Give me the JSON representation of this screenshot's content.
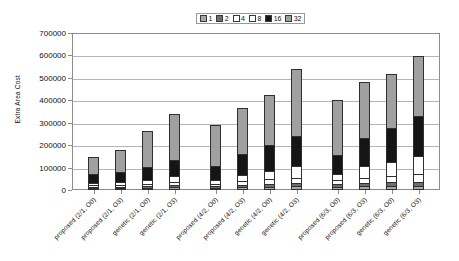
{
  "chart_data": {
    "type": "bar",
    "subtype": "stacked",
    "title": "",
    "xlabel": "",
    "ylabel": "Extra Area Cost",
    "ylim": [
      0,
      700000
    ],
    "ytick_step": 100000,
    "yticks": [
      "0",
      "100000",
      "200000",
      "300000",
      "400000",
      "500000",
      "600000",
      "700000"
    ],
    "grid": true,
    "legend_position": "top-center",
    "legend_title": "",
    "categories": [
      "proposed (2/1, O0)",
      "proposed (2/1, O3)",
      "genetic (2/1, O0)",
      "genetic (2/1, O3)",
      "proposed (4/2, O0)",
      "proposed (4/2, O3)",
      "genetic (4/2, O0)",
      "genetic (4/2, O3)",
      "proposed (6/3, O0)",
      "proposed (6/3, O3)",
      "genetic (6/3, O0)",
      "genetic (6/3, O3)"
    ],
    "series": [
      {
        "name": "1",
        "color": "#a8a8a8",
        "values": [
          8000,
          8000,
          10000,
          12000,
          10000,
          12000,
          14000,
          16000,
          14000,
          16000,
          18000,
          20000
        ]
      },
      {
        "name": "2",
        "color": "#6e6e6e",
        "values": [
          10000,
          10000,
          12000,
          14000,
          12000,
          14000,
          16000,
          18000,
          16000,
          18000,
          20000,
          22000
        ]
      },
      {
        "name": "4",
        "color": "#ffffff",
        "values": [
          14000,
          14000,
          16000,
          20000,
          16000,
          22000,
          26000,
          30000,
          22000,
          30000,
          34000,
          40000
        ]
      },
      {
        "name": "8",
        "color": "#ffffff",
        "values": [
          14000,
          16000,
          20000,
          28000,
          22000,
          34000,
          44000,
          56000,
          32000,
          56000,
          68000,
          82000
        ]
      },
      {
        "name": "16",
        "color": "#151515",
        "values": [
          44000,
          48000,
          62000,
          80000,
          66000,
          98000,
          120000,
          140000,
          92000,
          130000,
          156000,
          186000
        ]
      },
      {
        "name": "32",
        "color": "#a0a0a0",
        "values": [
          78000,
          104000,
          166000,
          208000,
          186000,
          210000,
          224000,
          302000,
          248000,
          252000,
          242000,
          272000
        ]
      }
    ],
    "bar_totals": [
      168000,
      200000,
      286000,
      362000,
      312000,
      390000,
      444000,
      562000,
      424000,
      502000,
      538000,
      622000
    ],
    "legend_entries": [
      "1",
      "2",
      "4",
      "8",
      "16",
      "32"
    ]
  }
}
